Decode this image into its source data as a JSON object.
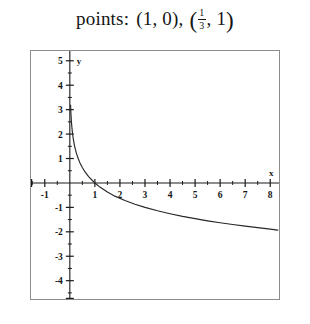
{
  "header": {
    "label": "points:",
    "point1": "(1, 0),",
    "point2_open": "(",
    "point2_frac_num": "1",
    "point2_frac_den": "3",
    "point2_rest": ", 1",
    "point2_close": ")"
  },
  "chart_data": {
    "type": "line",
    "title": "",
    "xlabel": "x",
    "ylabel": "y",
    "xlim": [
      -1.55,
      8.35
    ],
    "ylim": [
      -4.75,
      5.4
    ],
    "xticks": [
      -1,
      1,
      2,
      3,
      4,
      5,
      6,
      7,
      8
    ],
    "xticklabels": [
      "-1",
      "1",
      "2",
      "3",
      "4",
      "5",
      "6",
      "7",
      "8"
    ],
    "yticks": [
      5,
      4,
      3,
      2,
      1,
      -1,
      -2,
      -3,
      -4
    ],
    "yticklabels": [
      "5",
      "4",
      "3",
      "2",
      "1",
      "-1",
      "-2",
      "-3",
      "-4"
    ],
    "minor_tick_step": 0.5,
    "grid": false,
    "legend": false,
    "series": [
      {
        "name": "y = log base 1/3 of x",
        "x": [
          0.03,
          0.04,
          0.05,
          0.06,
          0.08,
          0.1,
          0.125,
          0.15,
          0.1818,
          0.2222,
          0.2667,
          0.3333,
          0.4,
          0.5,
          0.6,
          0.75,
          0.9,
          1.0,
          1.2,
          1.5,
          1.8,
          2.2,
          2.6,
          3.0,
          3.5,
          4.0,
          4.5,
          5.0,
          5.5,
          6.0,
          6.5,
          7.0,
          7.5,
          8.0,
          8.3
        ],
        "y": [
          3.19,
          2.93,
          2.73,
          2.56,
          2.3,
          2.1,
          1.89,
          1.73,
          1.55,
          1.37,
          1.2,
          1.0,
          0.83,
          0.63,
          0.46,
          0.26,
          0.1,
          0.0,
          -0.17,
          -0.37,
          -0.54,
          -0.72,
          -0.87,
          -1.0,
          -1.14,
          -1.26,
          -1.37,
          -1.46,
          -1.55,
          -1.63,
          -1.7,
          -1.77,
          -1.83,
          -1.89,
          -1.93
        ]
      }
    ],
    "x_axis_end_caps": true,
    "y_axis_end_caps": true
  }
}
